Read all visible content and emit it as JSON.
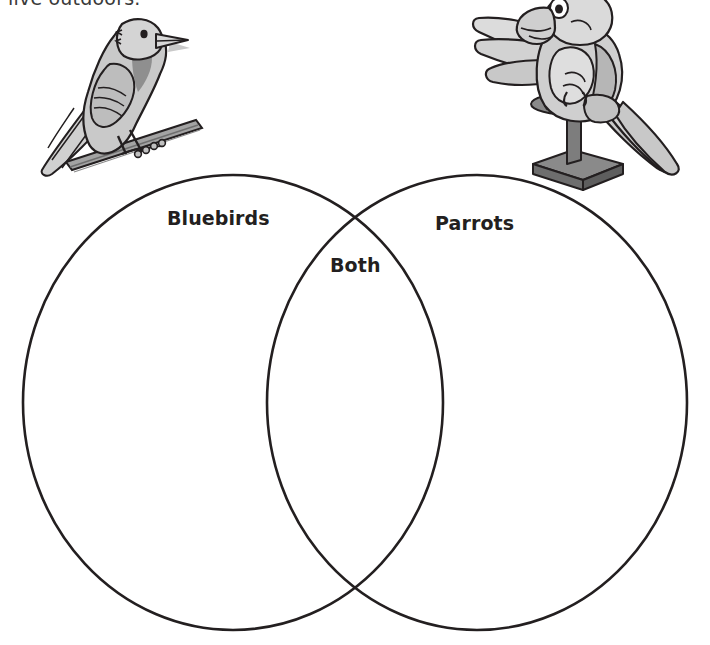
{
  "worksheet": {
    "instruction_line": "live outdoors.",
    "venn": {
      "left_label": "Bluebirds",
      "right_label": "Parrots",
      "overlap_label": "Both",
      "stroke_color": "#231f20",
      "background_color": "#ffffff"
    },
    "illustrations": {
      "left": {
        "name": "bluebird-illustration",
        "description": "Cartoon bluebird perched on a branch",
        "body_color": "#c6c6c6",
        "shade_color": "#8d8d8d",
        "outline_color": "#231f20"
      },
      "right": {
        "name": "parrot-illustration",
        "description": "Cartoon parrot standing on a perch stand",
        "body_color": "#d3d3d3",
        "shade_color": "#a8a8a8",
        "outline_color": "#231f20"
      }
    }
  }
}
